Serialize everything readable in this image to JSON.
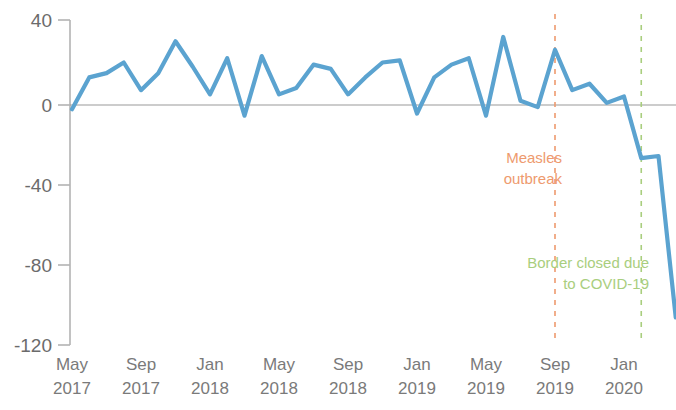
{
  "chart_data": {
    "type": "line",
    "title": "",
    "subtitle": "",
    "xlabel": "",
    "ylabel": "",
    "ylim": [
      -120,
      40
    ],
    "yticks": [
      40,
      0,
      -40,
      -80,
      -120
    ],
    "ytick_labels": [
      "40",
      "0",
      "-40",
      "-80",
      "-120"
    ],
    "grid": false,
    "legend": null,
    "zero_line": true,
    "x": [
      "May 2017",
      "Jun 2017",
      "Jul 2017",
      "Aug 2017",
      "Sep 2017",
      "Oct 2017",
      "Nov 2017",
      "Dec 2017",
      "Jan 2018",
      "Feb 2018",
      "Mar 2018",
      "Apr 2018",
      "May 2018",
      "Jun 2018",
      "Jul 2018",
      "Aug 2018",
      "Sep 2018",
      "Oct 2018",
      "Nov 2018",
      "Dec 2018",
      "Jan 2019",
      "Feb 2019",
      "Mar 2019",
      "Apr 2019",
      "May 2019",
      "Jun 2019",
      "Jul 2019",
      "Aug 2019",
      "Sep 2019",
      "Oct 2019",
      "Nov 2019",
      "Dec 2019",
      "Jan 2020",
      "Feb 2020",
      "Mar 2020",
      "Apr 2020"
    ],
    "xtick_labels": [
      "May 2017",
      "Sep 2017",
      "Jan 2018",
      "May 2018",
      "Sep 2018",
      "Jan 2019",
      "May 2019",
      "Sep 2019",
      "Jan 2020"
    ],
    "xtick_month_labels": [
      "May",
      "Sep",
      "Jan",
      "May",
      "Sep",
      "Jan",
      "May",
      "Sep",
      "Jan"
    ],
    "xtick_year_labels": [
      "2017",
      "2017",
      "2018",
      "2018",
      "2018",
      "2019",
      "2019",
      "2019",
      "2020"
    ],
    "series": [
      {
        "name": "Monthly change",
        "color": "#5BA3D0",
        "values": [
          -2,
          13,
          15,
          20,
          7,
          15,
          30,
          18,
          5,
          22,
          -5,
          23,
          5,
          8,
          19,
          17,
          5,
          13,
          20,
          21,
          -4,
          13,
          19,
          22,
          -5,
          32,
          2,
          -1,
          26,
          7,
          10,
          1,
          4,
          -25,
          -24,
          -100
        ]
      }
    ],
    "annotations": [
      {
        "id": "measles",
        "label_line1": "Measles",
        "label_line2": "outbreak",
        "color": "#EE9A6E",
        "x_at": "Sep 2019"
      },
      {
        "id": "covid",
        "label_line1": "Border closed due",
        "label_line2": "to COVID-19",
        "color": "#A9CE7E",
        "x_at": "Feb 2020"
      }
    ],
    "axis_color": "#b3b3b3",
    "zero_line_color": "#999999"
  }
}
